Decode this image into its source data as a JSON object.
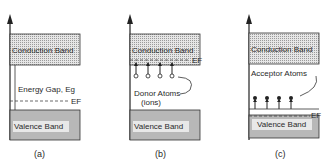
{
  "diagram": {
    "panels": [
      {
        "id": "a",
        "caption": "(a)",
        "conduction_band": "Conduction Band",
        "valence_band": "Valence Band",
        "gap_label": "Energy Gap, Eg",
        "fermi_label": "EF"
      },
      {
        "id": "b",
        "caption": "(b)",
        "conduction_band": "Conduction Band",
        "valence_band": "Valence Band",
        "fermi_label": "EF",
        "impurity_label_1": "Donor Atoms",
        "impurity_label_2": "(ions)",
        "impurity_count": 4
      },
      {
        "id": "c",
        "caption": "(c)",
        "conduction_band": "Conduction Band",
        "valence_band": "Valence Band",
        "fermi_label": "EF",
        "impurity_label_1": "Acceptor Atoms",
        "impurity_count": 4
      }
    ],
    "colors": {
      "conduction_fill": "#d9d9d9",
      "valence_fill": "#b8b8b8",
      "line": "#333333"
    }
  }
}
